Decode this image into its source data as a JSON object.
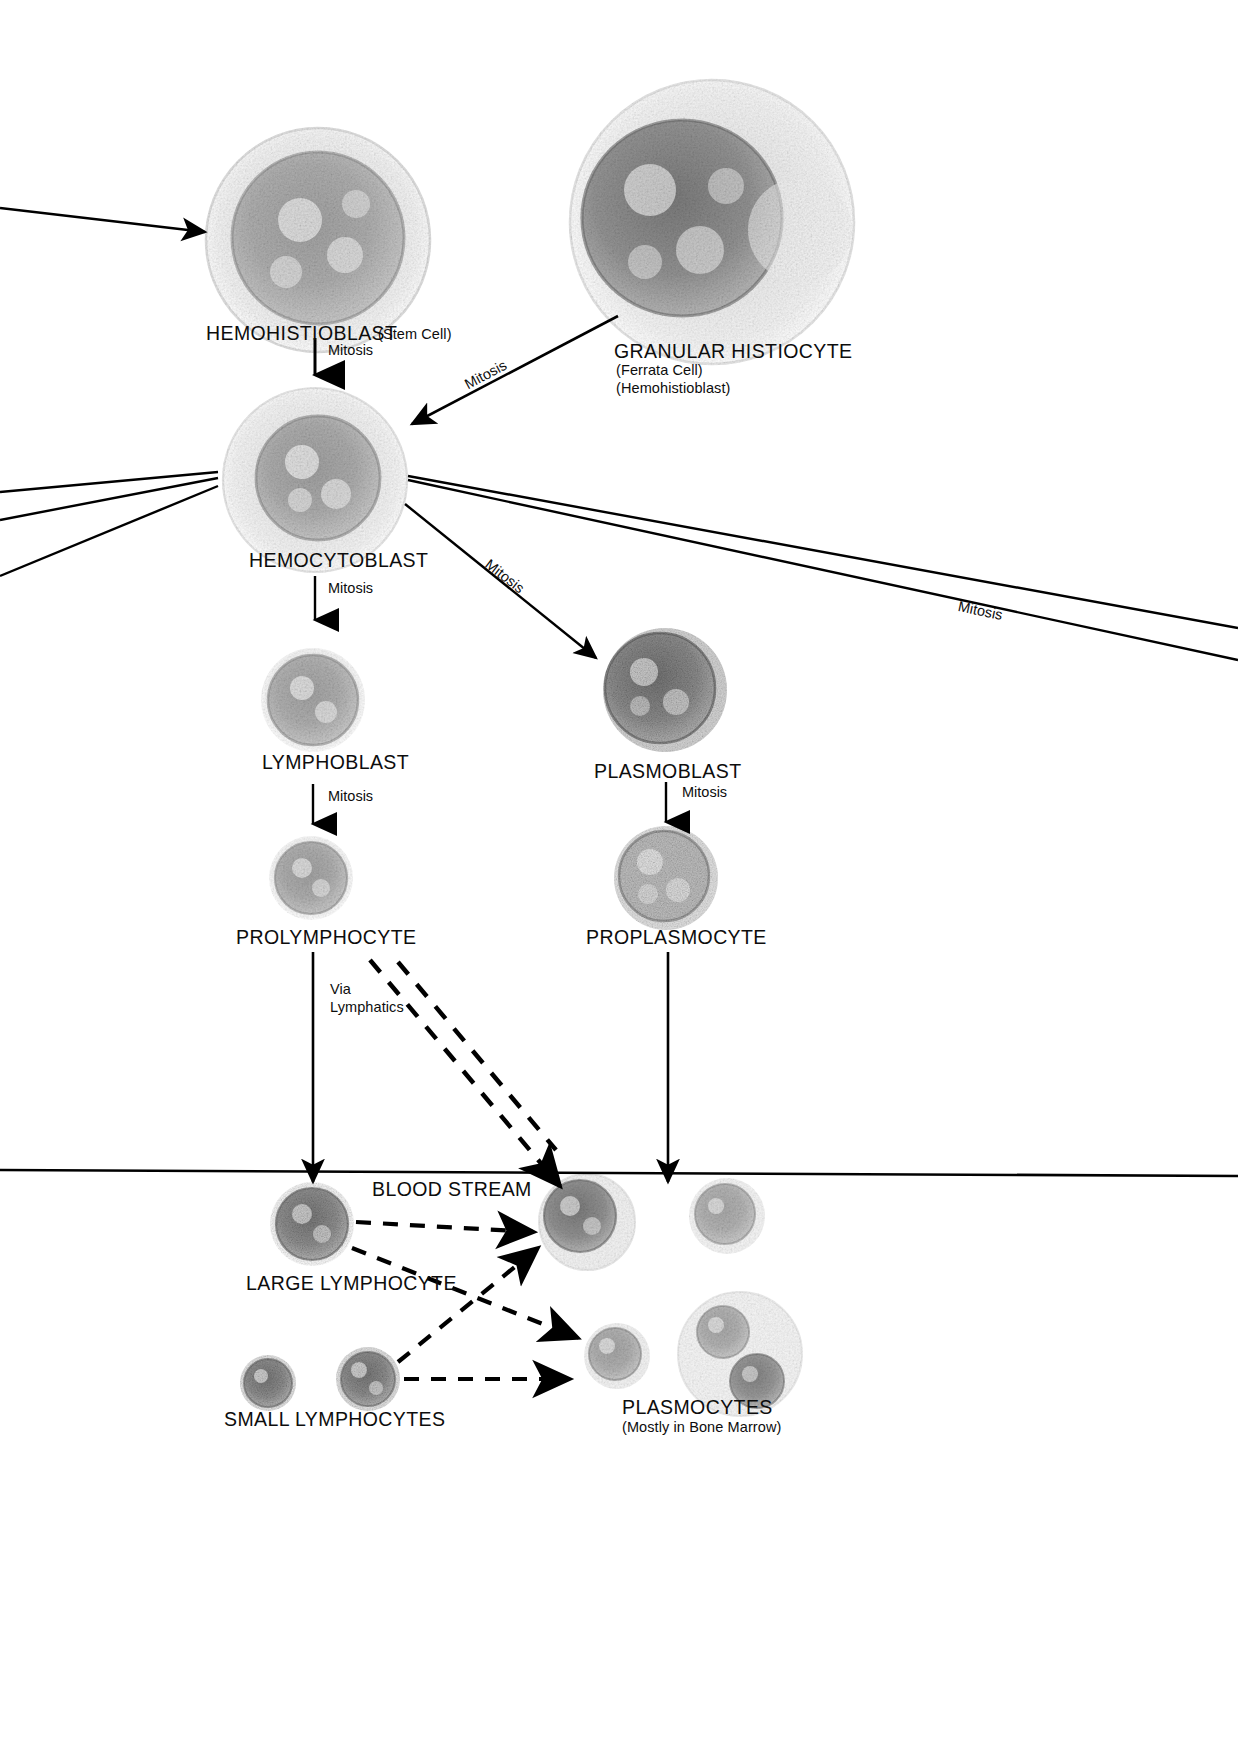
{
  "diagram": {
    "line_color": "#000000",
    "text_color": "#0d0d0d"
  },
  "nodes": [
    {
      "id": "hemohistioblast",
      "label": "HEMOHISTIOBLAST",
      "sub1": "(Stem Cell)",
      "sub2": ""
    },
    {
      "id": "granular-histiocyte",
      "label": "GRANULAR HISTIOCYTE",
      "sub1": "(Ferrata Cell)",
      "sub2": "(Hemohistioblast)"
    },
    {
      "id": "hemocytoblast",
      "label": "HEMOCYTOBLAST",
      "sub1": "",
      "sub2": ""
    },
    {
      "id": "lymphoblast",
      "label": "LYMPHOBLAST",
      "sub1": "",
      "sub2": ""
    },
    {
      "id": "plasmoblast",
      "label": "PLASMOBLAST",
      "sub1": "",
      "sub2": ""
    },
    {
      "id": "prolymphocyte",
      "label": "PROLYMPHOCYTE",
      "sub1": "",
      "sub2": ""
    },
    {
      "id": "proplasmocyte",
      "label": "PROPLASMOCYTE",
      "sub1": "",
      "sub2": ""
    },
    {
      "id": "large-lymphocyte",
      "label": "LARGE LYMPHOCYTE",
      "sub1": "",
      "sub2": ""
    },
    {
      "id": "small-lymphocytes",
      "label": "SMALL LYMPHOCYTES",
      "sub1": "",
      "sub2": ""
    },
    {
      "id": "plasmocytes",
      "label": "PLASMOCYTES",
      "sub1": "(Mostly in Bone Marrow)",
      "sub2": ""
    }
  ],
  "annotations": {
    "mitosis_1": "Mitosis",
    "mitosis_2": "Mitosis",
    "mitosis_3": "Mitosis",
    "mitosis_4": "Mitosis",
    "mitosis_5": "Mitosis",
    "mitosis_6": "Mitosis",
    "mitosis_7": "Mitosis",
    "via_lymphatics_line1": "Via",
    "via_lymphatics_line2": "Lymphatics",
    "blood_stream": "BLOOD STREAM"
  }
}
